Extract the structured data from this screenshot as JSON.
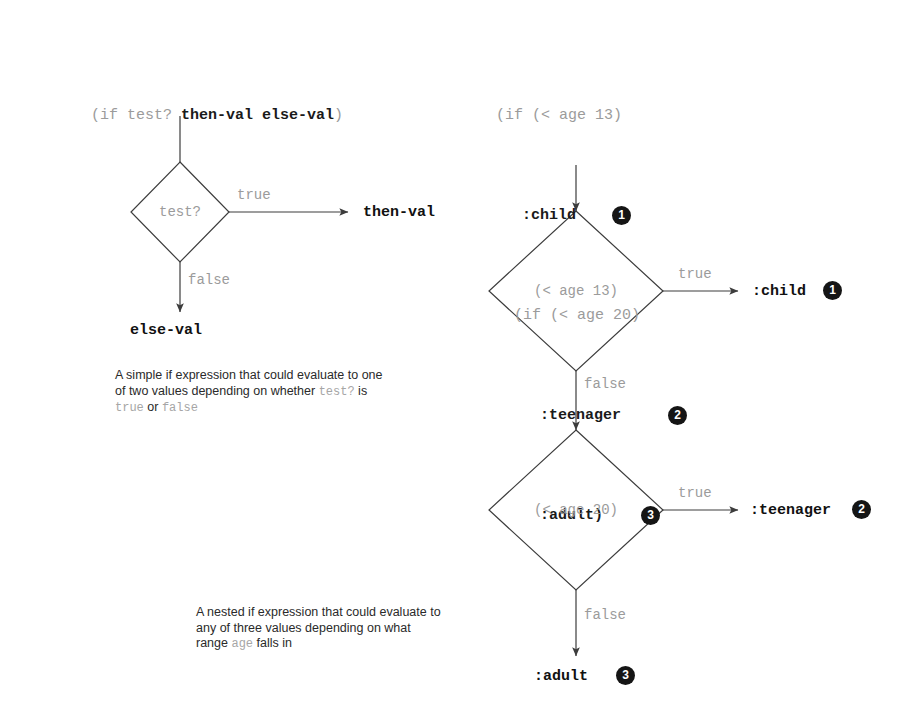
{
  "figure": {
    "title_hidden": "",
    "line_color": "#3c3c3c",
    "muted_color": "#9b9b9b",
    "ink_color": "#111111",
    "badge_color": "#151515"
  },
  "left_diagram": {
    "code_header": "(if test? then-val else-val)",
    "code_header_parts": {
      "prefix": "(if ",
      "test": "test? ",
      "then": "then-val",
      "space": " ",
      "else": "else-val",
      "suffix": ")"
    },
    "decision_label": "test?",
    "true_label": "true",
    "false_label": "false",
    "true_output": "then-val",
    "false_output": "else-val",
    "caption_line1": "A simple if expression that could evaluate to one",
    "caption_line2_a": "of two values depending on whether ",
    "caption_line2_code": "test?",
    "caption_line2_b": " is",
    "caption_line3_code_a": "true",
    "caption_line3_mid": " or ",
    "caption_line3_code_b": "false"
  },
  "right_diagram": {
    "code_lines": [
      {
        "text": "(if (< age 13)",
        "style": "light",
        "indent": 0,
        "badge": ""
      },
      {
        "text": ":child",
        "style": "bold",
        "indent": 26,
        "badge": "1"
      },
      {
        "text": "(if (< age 20)",
        "style": "light",
        "indent": 18,
        "badge": ""
      },
      {
        "text": ":teenager",
        "style": "bold",
        "indent": 44,
        "badge": "2"
      },
      {
        "text": ":adult)",
        "style": "bold",
        "indent": 44,
        "badge": "3"
      }
    ],
    "decision1_label": "(< age 13)",
    "decision2_label": "(< age 20)",
    "d1_true_label": "true",
    "d1_false_label": "false",
    "d2_true_label": "true",
    "d2_false_label": "false",
    "out1_text": ":child",
    "out1_badge": "1",
    "out2_text": ":teenager",
    "out2_badge": "2",
    "out3_text": ":adult",
    "out3_badge": "3",
    "caption_line1": "A nested if expression that could evaluate to",
    "caption_line2": "any of three values depending on what",
    "caption_line3_a": "range ",
    "caption_line3_code": "age",
    "caption_line3_b": " falls in"
  }
}
